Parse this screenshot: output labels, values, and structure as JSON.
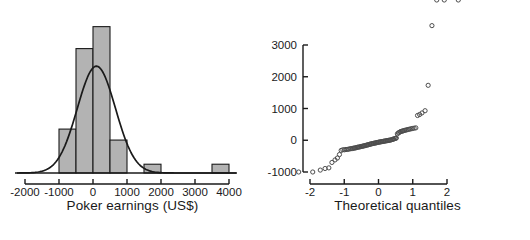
{
  "figure": {
    "panels": [
      "histogram",
      "qq-plot"
    ],
    "background_color": "#ffffff",
    "ink_color": "#1a1a1a"
  },
  "chart_data": [
    {
      "type": "bar",
      "name": "poker-earnings-histogram",
      "title": "",
      "xlabel": "Poker earnings (US$)",
      "ylabel": "",
      "xlim": [
        -2200,
        4100
      ],
      "ylim": [
        0,
        22
      ],
      "grid": false,
      "legend": false,
      "bin_width": 500,
      "bin_edges": [
        -1000,
        -500,
        0,
        500,
        1000,
        1500,
        2000,
        2500,
        3000,
        3500,
        4000
      ],
      "categories": [
        "-1000 to -500",
        "-500 to 0",
        "0 to 500",
        "500 to 1000",
        "1000 to 1500",
        "1500 to 2000",
        "2000 to 2500",
        "2500 to 3000",
        "3000 to 3500",
        "3500 to 4000"
      ],
      "values": [
        6,
        17,
        20,
        4.5,
        0,
        1.2,
        0,
        0,
        0,
        1.2
      ],
      "bar_fill_color": "#b3b3b3",
      "bar_edge_color": "#1a1a1a",
      "xticks": [
        -2000,
        -1000,
        0,
        1000,
        2000,
        3000,
        4000
      ],
      "xtick_labels": [
        "-2000",
        "-1000",
        "0",
        "1000",
        "2000",
        "3000",
        "4000"
      ],
      "overlay": {
        "type": "line",
        "name": "normal-density-curve",
        "color": "#1a1a1a",
        "mean": 100,
        "sd": 560,
        "peak_value": 14.6
      }
    },
    {
      "type": "scatter",
      "name": "normal-qq-plot",
      "title": "",
      "xlabel": "Theoretical quantiles",
      "ylabel": "",
      "xlim": [
        -2.45,
        2.45
      ],
      "ylim": [
        -1250,
        3750
      ],
      "grid": false,
      "legend": false,
      "marker": "open-circle",
      "marker_color": "#4d4d4d",
      "xticks": [
        -2,
        -1,
        0,
        1,
        2
      ],
      "xtick_labels": [
        "-2",
        "-1",
        "0",
        "1",
        "2"
      ],
      "yticks": [
        -1000,
        0,
        1000,
        2000,
        3000
      ],
      "ytick_labels": [
        "-1000",
        "0",
        "1000",
        "2000",
        "3000"
      ],
      "x": [
        -2.33,
        -1.92,
        -1.7,
        -1.56,
        -1.45,
        -1.36,
        -1.27,
        -1.2,
        -1.14,
        -1.09,
        -1.04,
        -0.99,
        -0.95,
        -0.91,
        -0.87,
        -0.83,
        -0.8,
        -0.76,
        -0.73,
        -0.7,
        -0.67,
        -0.64,
        -0.61,
        -0.58,
        -0.55,
        -0.52,
        -0.5,
        -0.47,
        -0.44,
        -0.42,
        -0.39,
        -0.36,
        -0.34,
        -0.31,
        -0.29,
        -0.26,
        -0.24,
        -0.21,
        -0.19,
        -0.16,
        -0.14,
        -0.11,
        -0.09,
        -0.06,
        -0.04,
        -0.01,
        0.01,
        0.04,
        0.06,
        0.09,
        0.11,
        0.14,
        0.16,
        0.19,
        0.21,
        0.24,
        0.26,
        0.29,
        0.31,
        0.34,
        0.36,
        0.39,
        0.42,
        0.44,
        0.47,
        0.5,
        0.52,
        0.55,
        0.58,
        0.61,
        0.64,
        0.67,
        0.7,
        0.73,
        0.76,
        0.8,
        0.83,
        0.87,
        0.91,
        0.95,
        0.99,
        1.04,
        1.09,
        1.14,
        1.2,
        1.27,
        1.36,
        1.45,
        1.56,
        1.7,
        1.92,
        2.33
      ],
      "y": [
        -1000,
        -1000,
        -940,
        -890,
        -870,
        -700,
        -620,
        -560,
        -450,
        -320,
        -300,
        -300,
        -290,
        -290,
        -280,
        -270,
        -265,
        -260,
        -250,
        -245,
        -240,
        -230,
        -220,
        -215,
        -210,
        -200,
        -195,
        -190,
        -180,
        -175,
        -170,
        -160,
        -150,
        -145,
        -140,
        -130,
        -120,
        -115,
        -110,
        -100,
        -95,
        -90,
        -85,
        -80,
        -70,
        -65,
        -60,
        -55,
        -50,
        -45,
        -40,
        -35,
        -30,
        -25,
        -20,
        -15,
        -10,
        -5,
        0,
        5,
        10,
        20,
        30,
        40,
        50,
        60,
        70,
        200,
        230,
        250,
        270,
        280,
        290,
        300,
        310,
        320,
        330,
        340,
        350,
        360,
        370,
        380,
        390,
        780,
        810,
        860,
        930,
        1730,
        3610
      ],
      "outliers": [
        {
          "x": 2.33,
          "y": 3610,
          "note": "top-right extreme"
        },
        {
          "x": 1.92,
          "y": 1730,
          "note": "upper-right"
        },
        {
          "x": -2.33,
          "y": -1000,
          "note": "lower-left"
        }
      ]
    }
  ],
  "labels": {
    "hist_xlabel": "Poker earnings (US$)",
    "qq_xlabel": "Theoretical quantiles"
  }
}
